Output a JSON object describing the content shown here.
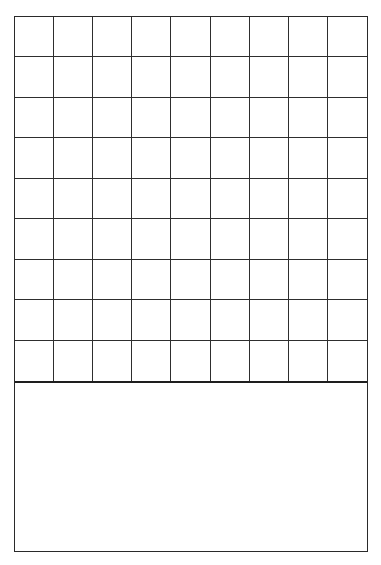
{
  "grid": {
    "rows": 9,
    "columns": 9,
    "line_color": "#2e2e2e",
    "border_color": "#2a2a2a",
    "background": "#ffffff"
  },
  "notes_box": {
    "content": ""
  }
}
